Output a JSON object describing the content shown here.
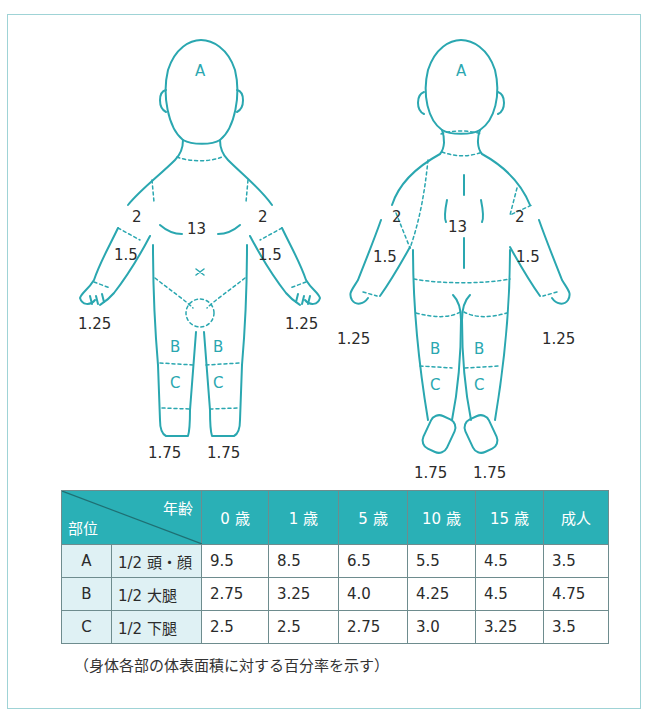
{
  "figures": {
    "front": {
      "head_label": "A",
      "trunk": "13",
      "upper_arm_left": "2",
      "upper_arm_right": "2",
      "forearm_left": "1.5",
      "forearm_right": "1.5",
      "hand_left": "1.25",
      "hand_right": "1.25",
      "thigh_left": "B",
      "thigh_right": "B",
      "leg_left": "C",
      "leg_right": "C",
      "foot_left": "1.75",
      "foot_right": "1.75"
    },
    "back": {
      "head_label": "A",
      "trunk": "13",
      "upper_arm_left": "2",
      "upper_arm_right": "2",
      "forearm_left": "1.5",
      "forearm_right": "1.5",
      "hand_left": "1.25",
      "hand_right": "1.25",
      "thigh_left": "B",
      "thigh_right": "B",
      "leg_left": "C",
      "leg_right": "C",
      "foot_left": "1.75",
      "foot_right": "1.75"
    }
  },
  "table": {
    "corner_age": "年齢",
    "corner_part": "部位",
    "age_headers": [
      "0 歳",
      "1 歳",
      "5 歳",
      "10 歳",
      "15 歳",
      "成人"
    ],
    "rows": [
      {
        "code": "A",
        "part": "1/2 頭・顔",
        "values": [
          "9.5",
          "8.5",
          "6.5",
          "5.5",
          "4.5",
          "3.5"
        ]
      },
      {
        "code": "B",
        "part": "1/2 大腿",
        "values": [
          "2.75",
          "3.25",
          "4.0",
          "4.25",
          "4.5",
          "4.75"
        ]
      },
      {
        "code": "C",
        "part": "1/2 下腿",
        "values": [
          "2.5",
          "2.5",
          "2.75",
          "3.0",
          "3.25",
          "3.5"
        ]
      }
    ]
  },
  "note": "（身体各部の体表面積に対する百分率を示す）",
  "colors": {
    "outline": "#2aa7b0",
    "header_bg": "#2ab0b6",
    "label_bg": "#dff1f4",
    "frame": "#9fd3d6"
  }
}
